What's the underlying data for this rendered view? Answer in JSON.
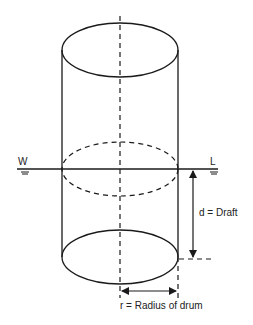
{
  "diagram": {
    "type": "floating-drum-cross-section",
    "labels": {
      "water_left": "W",
      "water_right": "L",
      "draft": "d = Draft",
      "radius": "r = Radius of drum"
    },
    "colors": {
      "stroke": "#1a1a1a",
      "background": "#ffffff"
    }
  }
}
